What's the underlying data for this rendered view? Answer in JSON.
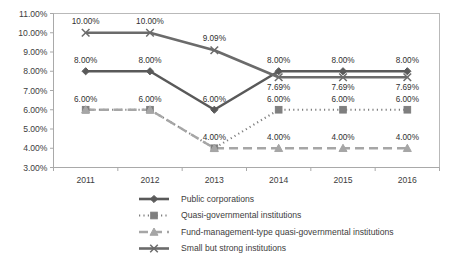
{
  "chart_data": {
    "type": "line",
    "title": "",
    "xlabel": "",
    "ylabel": "",
    "categories": [
      "2011",
      "2012",
      "2013",
      "2014",
      "2015",
      "2016"
    ],
    "ylim": [
      3.0,
      11.0
    ],
    "ytick_labels": [
      "3.00%",
      "4.00%",
      "5.00%",
      "6.00%",
      "7.00%",
      "8.00%",
      "9.00%",
      "10.00%",
      "11.00%"
    ],
    "ytick_values": [
      3,
      4,
      5,
      6,
      7,
      8,
      9,
      10,
      11
    ],
    "grid": false,
    "legend_position": "bottom",
    "series": [
      {
        "name": "Public corporations",
        "marker": "diamond",
        "line_style": "solid",
        "color": "#595959",
        "values": [
          8.0,
          8.0,
          6.0,
          8.0,
          8.0,
          8.0
        ],
        "labels": [
          "8.00%",
          "8.00%",
          "6.00%",
          "8.00%",
          "8.00%",
          "8.00%"
        ]
      },
      {
        "name": "Quasi-governmental institutions",
        "marker": "square",
        "line_style": "dotted",
        "color": "#7f7f7f",
        "values": [
          6.0,
          6.0,
          4.0,
          6.0,
          6.0,
          6.0
        ],
        "labels": [
          "6.00%",
          "6.00%",
          "4.00%",
          "6.00%",
          "6.00%",
          "6.00%"
        ]
      },
      {
        "name": "Fund-management-type quasi-governmental institutions",
        "marker": "triangle",
        "line_style": "dashed",
        "color": "#a6a6a6",
        "values": [
          6.0,
          6.0,
          4.0,
          4.0,
          4.0,
          4.0
        ],
        "labels": [
          "",
          "",
          "",
          "4.00%",
          "4.00%",
          "4.00%"
        ]
      },
      {
        "name": "Small but strong institutions",
        "marker": "x",
        "line_style": "solid",
        "color": "#6b6b6b",
        "values": [
          10.0,
          10.0,
          9.09,
          7.69,
          7.69,
          7.69
        ],
        "labels": [
          "10.00%",
          "10.00%",
          "9.09%",
          "7.69%",
          "7.69%",
          "7.69%"
        ]
      }
    ]
  },
  "legend": {
    "items": [
      {
        "label": "Public corporations"
      },
      {
        "label": "Quasi-governmental institutions"
      },
      {
        "label": "Fund-management-type quasi-governmental institutions"
      },
      {
        "label": "Small but strong institutions"
      }
    ]
  },
  "colors": {
    "axis": "#a9a9a9",
    "plot_border": "#b5b5b5",
    "text": "#3d3d3d",
    "series1": "#595959",
    "series2": "#7f7f7f",
    "series3": "#a6a6a6",
    "series4": "#6b6b6b"
  }
}
